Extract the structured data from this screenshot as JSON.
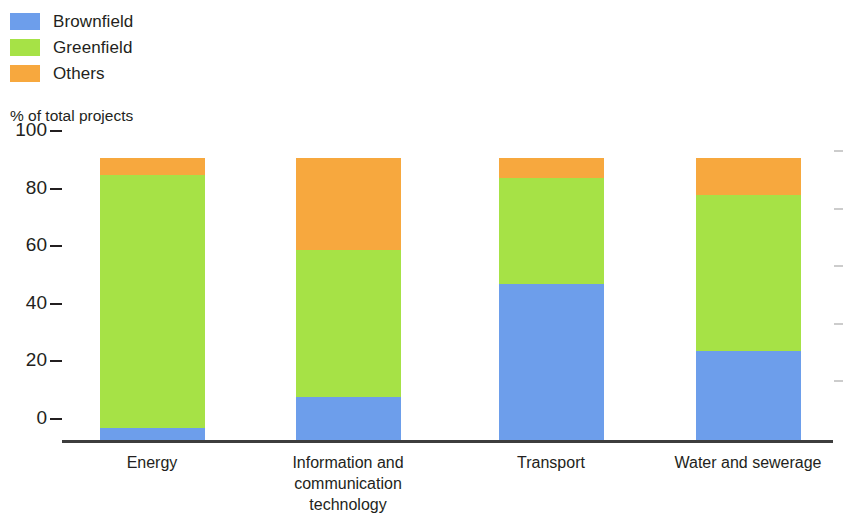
{
  "legend": {
    "items": [
      {
        "label": "Brownfield",
        "color": "#6d9eeb",
        "swatch_name": "legend-swatch-brownfield"
      },
      {
        "label": "Greenfield",
        "color": "#a6e246",
        "swatch_name": "legend-swatch-greenfield"
      },
      {
        "label": "Others",
        "color": "#f7a83e",
        "swatch_name": "legend-swatch-others"
      }
    ]
  },
  "axis_title": "% of total projects",
  "chart_data": {
    "type": "bar",
    "subtype": "stacked-vertical",
    "title": "",
    "subtitle": "",
    "xlabel": "",
    "ylabel": "% of total projects",
    "ylim": [
      0,
      100
    ],
    "yticks": [
      0,
      20,
      40,
      60,
      80,
      100
    ],
    "grid": false,
    "legend_position": "top-left",
    "stacked": true,
    "categories": [
      "Energy",
      "Information and communication technology",
      "Transport",
      "Water and sewerage"
    ],
    "category_label_lines": [
      [
        "Energy"
      ],
      [
        "Information and",
        "communication",
        "technology"
      ],
      [
        "Transport"
      ],
      [
        "Water and sewerage"
      ]
    ],
    "series": [
      {
        "name": "Brownfield",
        "color": "#6d9eeb",
        "values": [
          4,
          15,
          54,
          31
        ]
      },
      {
        "name": "Greenfield",
        "color": "#a6e246",
        "values": [
          88,
          51,
          37,
          54
        ]
      },
      {
        "name": "Others",
        "color": "#f7a83e",
        "values": [
          6,
          32,
          7,
          13
        ]
      }
    ],
    "cumulative_tops": [
      [
        4,
        92,
        98
      ],
      [
        15,
        66,
        98
      ],
      [
        54,
        91,
        98
      ],
      [
        31,
        85,
        98
      ]
    ]
  }
}
